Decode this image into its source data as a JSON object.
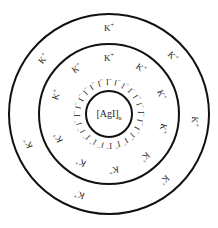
{
  "core": {
    "label": "[AgI]",
    "subscript": "n"
  },
  "adsorbed_layer": {
    "ion": "I",
    "charge": "−",
    "count": 24,
    "radius": 32
  },
  "counter_ion": {
    "ion": "K",
    "charge": "+"
  },
  "geometry": {
    "center": [
      109,
      114
    ],
    "inner_radius": 23,
    "middle_radius": 70,
    "outer_radius": 100
  },
  "middle_band_counter_ions": [
    {
      "angle": 0,
      "r": 56
    },
    {
      "angle": 35,
      "r": 56
    },
    {
      "angle": 70,
      "r": 56
    },
    {
      "angle": 105,
      "r": 56
    },
    {
      "angle": 140,
      "r": 56
    },
    {
      "angle": 175,
      "r": 56
    },
    {
      "angle": 210,
      "r": 56
    },
    {
      "angle": 245,
      "r": 56
    },
    {
      "angle": 290,
      "r": 56
    },
    {
      "angle": 325,
      "r": 56
    }
  ],
  "outer_band_counter_ions": [
    {
      "angle": 0,
      "r": 86
    },
    {
      "angle": 48,
      "r": 86
    },
    {
      "angle": 95,
      "r": 86
    },
    {
      "angle": 140,
      "r": 86
    },
    {
      "angle": 200,
      "r": 86
    },
    {
      "angle": 250,
      "r": 86
    },
    {
      "angle": 310,
      "r": 86
    }
  ]
}
